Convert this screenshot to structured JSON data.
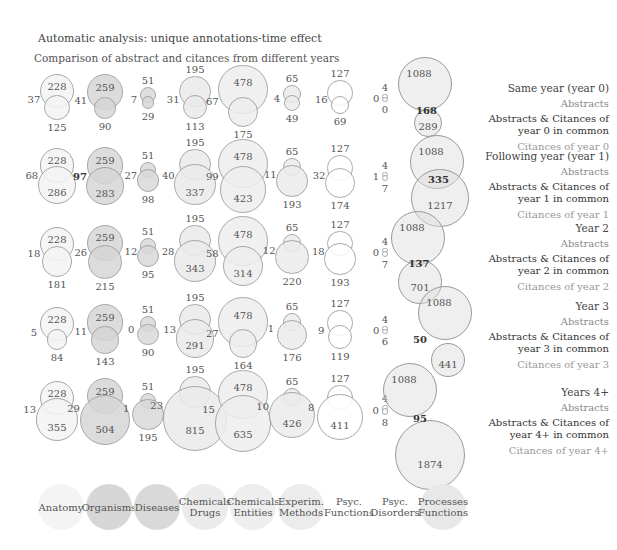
{
  "header": {
    "title": "Automatic analysis: unique annotations-time effect",
    "subtitle": "Comparison of abstract and citances from diﬀerent years"
  },
  "categories": [
    {
      "label_line1": "Anatomy",
      "label_line2": "",
      "fill": "#f4f4f4"
    },
    {
      "label_line1": "Organisms",
      "label_line2": "",
      "fill": "#d6d6d6"
    },
    {
      "label_line1": "Diseases",
      "label_line2": "",
      "fill": "#d9d9d9"
    },
    {
      "label_line1": "Chemicals",
      "label_line2": "Drugs",
      "fill": "#ebebeb"
    },
    {
      "label_line1": "Chemicals",
      "label_line2": "Entities",
      "fill": "#eeeeee"
    },
    {
      "label_line1": "Experim.",
      "label_line2": "Methods",
      "fill": "#ececec"
    },
    {
      "label_line1": "Psyc.",
      "label_line2": "Functions",
      "fill": "#ffffff"
    },
    {
      "label_line1": "Psyc.",
      "label_line2": "Disorders",
      "fill": "#ffffff"
    },
    {
      "label_line1": "Processes",
      "label_line2": "Functions",
      "fill": "#e8e8e8"
    }
  ],
  "rows": [
    {
      "label": "Same year (year 0)",
      "abstracts_label": "Abstracts",
      "common_label_1": "Abstracts & Citances of",
      "common_label_2": "year 0 in common",
      "citances_label": "Citances of year 0",
      "cells": [
        {
          "abstracts": "228",
          "common": "37",
          "citances": "125"
        },
        {
          "abstracts": "259",
          "common": "41",
          "citances": "90"
        },
        {
          "abstracts": "51",
          "common": "7",
          "citances": "29"
        },
        {
          "abstracts": "195",
          "common": "31",
          "citances": "113"
        },
        {
          "abstracts": "478",
          "common": "67",
          "citances": "175"
        },
        {
          "abstracts": "65",
          "common": "4",
          "citances": "49"
        },
        {
          "abstracts": "127",
          "common": "16",
          "citances": "69"
        },
        {
          "abstracts": "4",
          "common": "0",
          "citances": "0"
        },
        {
          "abstracts": "1088",
          "common": "168",
          "citances": "289"
        }
      ]
    },
    {
      "label": "Following year (year 1)",
      "abstracts_label": "Abstracts",
      "common_label_1": "Abstracts & Citances of",
      "common_label_2": "year 1 in common",
      "citances_label": "Citances of year 1",
      "cells": [
        {
          "abstracts": "228",
          "common": "68",
          "citances": "286"
        },
        {
          "abstracts": "259",
          "common": "97",
          "citances": "283"
        },
        {
          "abstracts": "51",
          "common": "27",
          "citances": "98"
        },
        {
          "abstracts": "195",
          "common": "40",
          "citances": "337"
        },
        {
          "abstracts": "478",
          "common": "99",
          "citances": "423"
        },
        {
          "abstracts": "65",
          "common": "11",
          "citances": "193"
        },
        {
          "abstracts": "127",
          "common": "32",
          "citances": "174"
        },
        {
          "abstracts": "4",
          "common": "1",
          "citances": "7"
        },
        {
          "abstracts": "1088",
          "common": "335",
          "citances": "1217"
        }
      ]
    },
    {
      "label": "Year 2",
      "abstracts_label": "Abstracts",
      "common_label_1": "Abstracts & Citances of",
      "common_label_2": "year 2 in common",
      "citances_label": "Citances of year 2",
      "cells": [
        {
          "abstracts": "228",
          "common": "18",
          "citances": "181"
        },
        {
          "abstracts": "259",
          "common": "26",
          "citances": "215"
        },
        {
          "abstracts": "51",
          "common": "12",
          "citances": "95"
        },
        {
          "abstracts": "195",
          "common": "28",
          "citances": "343"
        },
        {
          "abstracts": "478",
          "common": "58",
          "citances": "314"
        },
        {
          "abstracts": "65",
          "common": "12",
          "citances": "220"
        },
        {
          "abstracts": "127",
          "common": "18",
          "citances": "193"
        },
        {
          "abstracts": "4",
          "common": "0",
          "citances": "7"
        },
        {
          "abstracts": "1088",
          "common": "137",
          "citances": "701"
        }
      ]
    },
    {
      "label": "Year 3",
      "abstracts_label": "Abstracts",
      "common_label_1": "Abstracts & Citances of",
      "common_label_2": "year 3 in common",
      "citances_label": "Citances of year 3",
      "cells": [
        {
          "abstracts": "228",
          "common": "5",
          "citances": "84"
        },
        {
          "abstracts": "259",
          "common": "11",
          "citances": "143"
        },
        {
          "abstracts": "51",
          "common": "0",
          "citances": "90"
        },
        {
          "abstracts": "195",
          "common": "13",
          "citances": "291"
        },
        {
          "abstracts": "478",
          "common": "27",
          "citances": "164"
        },
        {
          "abstracts": "65",
          "common": "1",
          "citances": "176"
        },
        {
          "abstracts": "127",
          "common": "9",
          "citances": "119"
        },
        {
          "abstracts": "4",
          "common": "0",
          "citances": "6"
        },
        {
          "abstracts": "1088",
          "common": "50",
          "citances": "441"
        }
      ]
    },
    {
      "label": "Years 4+",
      "abstracts_label": "Abstracts",
      "common_label_1": "Abstracts & Citances of",
      "common_label_2": "year 4+ in common",
      "citances_label": "Citances of year 4+",
      "cells": [
        {
          "abstracts": "228",
          "common": "13",
          "citances": "355"
        },
        {
          "abstracts": "259",
          "common": "29",
          "citances": "504"
        },
        {
          "abstracts": "51",
          "common": "1",
          "citances": "195"
        },
        {
          "abstracts": "195",
          "common": "23",
          "citances": "815"
        },
        {
          "abstracts": "478",
          "common": "15",
          "citances": "635"
        },
        {
          "abstracts": "65",
          "common": "10",
          "citances": "426"
        },
        {
          "abstracts": "127",
          "common": "8",
          "citances": "411"
        },
        {
          "abstracts": "4",
          "common": "0",
          "citances": "8"
        },
        {
          "abstracts": "1088",
          "common": "95",
          "citances": "1874"
        }
      ]
    }
  ]
}
